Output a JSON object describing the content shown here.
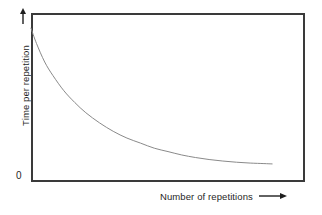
{
  "figure": {
    "background_color": "#ffffff",
    "frame_color": "#3a3a3a",
    "curve_color": "#8a8a8a",
    "text_color": "#1f1f1f",
    "origin_label": "0",
    "y_axis_arrow_name": "up-arrow-icon",
    "x_axis_arrow_name": "right-arrow-icon"
  },
  "chart_data": {
    "type": "line",
    "title": "",
    "subtitle": "",
    "xlabel": "Number of repetitions",
    "ylabel": "Time per repetition",
    "annotations": [
      "0"
    ],
    "legend": [],
    "legend_position": "none",
    "grid": false,
    "axis_ticks": {
      "x": [],
      "y": [
        "0"
      ]
    },
    "xlim": [
      0,
      100
    ],
    "ylim": [
      0,
      100
    ],
    "axis_style": "box-frame-no-ticks-arrows",
    "series": [
      {
        "name": "Learning curve",
        "color": "#8a8a8a",
        "line_width": 1,
        "x": [
          0,
          2,
          5,
          8,
          12,
          16,
          20,
          25,
          30,
          35,
          40,
          45,
          50,
          55,
          60,
          65,
          70,
          75,
          80,
          85,
          88
        ],
        "y": [
          91,
          82,
          71,
          63,
          54,
          47,
          41,
          35,
          30,
          26,
          23,
          20,
          18,
          16,
          14.5,
          13.3,
          12.4,
          11.7,
          11.2,
          10.9,
          10.7
        ]
      }
    ]
  }
}
